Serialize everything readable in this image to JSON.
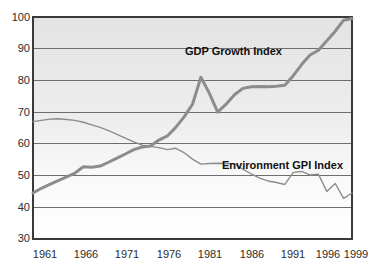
{
  "chart_data": {
    "type": "line",
    "title": "",
    "xlabel": "",
    "ylabel": "",
    "xlim": [
      1961,
      1999
    ],
    "ylim": [
      30,
      100
    ],
    "grid": true,
    "legend_position": "inline-annotations",
    "y_ticks": [
      100,
      90,
      80,
      70,
      60,
      50,
      40,
      30
    ],
    "x_ticks": [
      1961,
      1966,
      1971,
      1976,
      1981,
      1986,
      1991,
      1996,
      1999
    ],
    "x": [
      1961,
      1962,
      1963,
      1964,
      1965,
      1966,
      1967,
      1968,
      1969,
      1970,
      1971,
      1972,
      1973,
      1974,
      1975,
      1976,
      1977,
      1978,
      1979,
      1980,
      1981,
      1982,
      1983,
      1984,
      1985,
      1986,
      1987,
      1988,
      1989,
      1990,
      1991,
      1992,
      1993,
      1994,
      1995,
      1996,
      1997,
      1998,
      1999
    ],
    "series": [
      {
        "name": "GDP Growth Index",
        "color": "#8c8c8c",
        "width": 3,
        "values": [
          44.5,
          46.0,
          47.2,
          48.4,
          49.6,
          50.8,
          52.8,
          52.6,
          53.0,
          54.2,
          55.5,
          56.8,
          58.2,
          59.0,
          59.3,
          61.2,
          62.5,
          65.2,
          68.5,
          72.5,
          81.0,
          76.0,
          70.0,
          72.5,
          75.5,
          77.5,
          78.0,
          78.1,
          78.0,
          78.2,
          78.5,
          81.5,
          85.0,
          88.0,
          89.5,
          92.5,
          95.5,
          99.0,
          99.5
        ]
      },
      {
        "name": "Environment GPI Index",
        "color": "#8c8c8c",
        "width": 1.4,
        "values": [
          67.0,
          67.4,
          67.8,
          67.9,
          67.7,
          67.4,
          66.8,
          66.0,
          65.2,
          64.2,
          63.0,
          61.8,
          60.6,
          59.6,
          59.2,
          58.8,
          58.2,
          58.6,
          57.2,
          55.2,
          53.6,
          53.8,
          53.9,
          53.8,
          53.7,
          52.0,
          50.5,
          49.2,
          48.3,
          47.8,
          47.2,
          51.0,
          51.3,
          50.2,
          50.4,
          45.0,
          47.5,
          42.8,
          44.5
        ]
      }
    ],
    "annotations": [
      {
        "text": "GDP Growth Index",
        "x_px": 185,
        "y_px": 50
      },
      {
        "text": "Environment GPI Index",
        "x_px": 222,
        "y_px": 164
      }
    ]
  },
  "axis": {
    "y_tick_labels": [
      "100",
      "90",
      "80",
      "70",
      "60",
      "50",
      "40",
      "30"
    ],
    "x_tick_labels": [
      "1961",
      "1966",
      "1971",
      "1976",
      "1981",
      "1986",
      "1991",
      "1996",
      "1999"
    ]
  },
  "colors": {
    "line": "#8c8c8c",
    "gridline": "#6e6e6e",
    "axis": "#3a3a3a",
    "plot_top": "#e2e2e2",
    "plot_bottom": "#ffffff",
    "text": "#2b2b2b"
  }
}
